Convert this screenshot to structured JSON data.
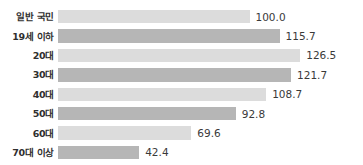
{
  "chart_data": {
    "type": "bar",
    "orientation": "horizontal",
    "title": "",
    "subtitle": "",
    "xlabel": "",
    "ylabel": "",
    "grid": false,
    "legend": null,
    "axis_visible": false,
    "xlim": [
      0,
      126.5
    ],
    "value_format": "one-decimal",
    "categories": [
      "일반 국민",
      "19세 이하",
      "20대",
      "30대",
      "40대",
      "50대",
      "60대",
      "70대 이상"
    ],
    "values": [
      100.0,
      115.7,
      126.5,
      121.7,
      108.7,
      92.8,
      69.6,
      42.4
    ],
    "value_labels": [
      "100.0",
      "115.7",
      "126.5",
      "121.7",
      "108.7",
      "92.8",
      "69.6",
      "42.4"
    ],
    "bar_colors": [
      "#dcdcdc",
      "#b6b6b6",
      "#dcdcdc",
      "#b6b6b6",
      "#dcdcdc",
      "#b6b6b6",
      "#dcdcdc",
      "#b6b6b6"
    ],
    "colors": {
      "light_bar": "#dcdcdc",
      "dark_bar": "#b6b6b6",
      "label_text": "#2f2f2f",
      "value_text": "#3a3a3a",
      "background": "#ffffff"
    }
  }
}
